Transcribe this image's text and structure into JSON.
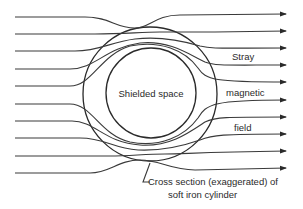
{
  "diagram": {
    "center_label": "Shielded space",
    "side_labels": [
      "Stray",
      "magnetic",
      "field"
    ],
    "caption_line1": "Cross section (exaggerated) of",
    "caption_line2": "soft iron cylinder",
    "line_color": "#3a3a3a",
    "field_line_count": 10,
    "inner_circle": {
      "cx": 151,
      "cy": 93,
      "r": 45
    },
    "outer_circle": {
      "cx": 150,
      "cy": 94,
      "r": 67
    }
  }
}
